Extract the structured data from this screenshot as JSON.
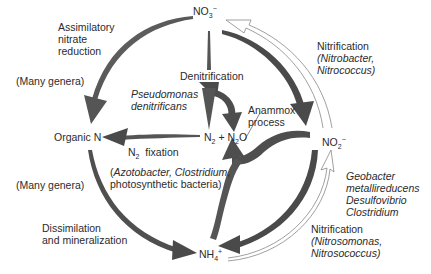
{
  "diagram": {
    "type": "nitrogen-cycle",
    "colors": {
      "arrow_fill": "#5a5a5a",
      "arrow_dark": "#3d3d3d",
      "outline_arrow": "#888888",
      "text": "#2b2b2b"
    },
    "nodes": {
      "nitrate": {
        "base": "NO",
        "sub": "3",
        "sup": "−"
      },
      "organic_n": {
        "label": "Organic N"
      },
      "n2_n2o": {
        "a": "N",
        "a_sub": "2",
        "plus": " + N",
        "b_sub": "2",
        "b": "O"
      },
      "nitrite": {
        "base": "NO",
        "sub": "2",
        "sup": "−"
      },
      "ammonium": {
        "base": "NH",
        "sub": "4",
        "sup": "+"
      }
    },
    "labels": {
      "assimilatory": [
        "Assimilatory",
        "nitrate",
        "reduction"
      ],
      "many_genera_top": "(Many genera)",
      "denitrification": "Denitrification",
      "pseudomonas": [
        "Pseudomonas",
        "denitrificans"
      ],
      "anammox": [
        "Anammox",
        "process"
      ],
      "n2_fixation": {
        "pre": "N",
        "sub": "2",
        "post": "  fixation"
      },
      "fixation_orgs": [
        "(Azotobacter, Clostridium,",
        "photosynthetic bacteria)"
      ],
      "fixation_orgs_parts": {
        "open": "(",
        "it1": "Azotobacter, Clostridium",
        "comma": ",",
        "line2": "photosynthetic bacteria)"
      },
      "many_genera_bottom": "(Many genera)",
      "dissimilation": [
        "Dissimilation",
        "and mineralization"
      ],
      "nitrification_top": {
        "title": "Nitrification",
        "orgs": [
          "(Nitrobacter,",
          "Nitrococcus)"
        ]
      },
      "geobacter": [
        "Geobacter",
        "metallireducens",
        "Desulfovibrio",
        "Clostridium"
      ],
      "nitrification_bottom": {
        "title": "Nitrification",
        "orgs": [
          "(Nitrosomonas,",
          "Nitrosococcus)"
        ]
      }
    }
  }
}
